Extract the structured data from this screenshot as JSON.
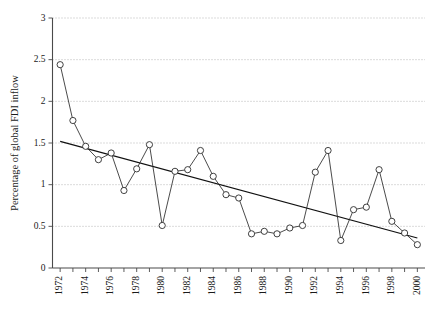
{
  "chart_data": {
    "type": "line",
    "title": "",
    "xlabel": "",
    "ylabel": "Percentage of global FDI inflow",
    "xlim": [
      1971.4,
      2000.6
    ],
    "ylim": [
      0,
      3
    ],
    "yticks": [
      0,
      0.5,
      1,
      1.5,
      2,
      2.5,
      3
    ],
    "ytick_labels": [
      "0",
      "0.5",
      "1",
      "1.5",
      "2",
      "2.5",
      "3"
    ],
    "grid": "horizontal-dotted",
    "legend": "none",
    "x": [
      1972,
      1973,
      1974,
      1975,
      1976,
      1977,
      1978,
      1979,
      1980,
      1981,
      1982,
      1983,
      1984,
      1985,
      1986,
      1987,
      1988,
      1989,
      1990,
      1991,
      1992,
      1993,
      1994,
      1995,
      1996,
      1997,
      1998,
      1999,
      2000
    ],
    "xtick_labels": [
      "1972",
      "1974",
      "1976",
      "1978",
      "1980",
      "1982",
      "1984",
      "1986",
      "1988",
      "1990",
      "1992",
      "1994",
      "1996",
      "1998",
      "2000"
    ],
    "xtick_label_years": [
      1972,
      1974,
      1976,
      1978,
      1980,
      1982,
      1984,
      1986,
      1988,
      1990,
      1992,
      1994,
      1996,
      1998,
      2000
    ],
    "xtick_label_rotation": -90,
    "series": [
      {
        "name": "Percentage of global FDI inflow",
        "marker": "open-circle",
        "values": [
          2.44,
          1.77,
          1.46,
          1.3,
          1.38,
          0.93,
          1.19,
          1.48,
          0.51,
          1.16,
          1.18,
          1.41,
          1.1,
          0.88,
          0.84,
          0.41,
          0.44,
          0.41,
          0.48,
          0.51,
          1.15,
          1.41,
          0.33,
          0.7,
          0.73,
          1.18,
          0.56,
          0.42,
          0.28
        ]
      }
    ],
    "trendline": {
      "name": "linear-trend",
      "x_start": 1972,
      "x_end": 2000,
      "y_start": 1.52,
      "y_end": 0.36
    }
  }
}
